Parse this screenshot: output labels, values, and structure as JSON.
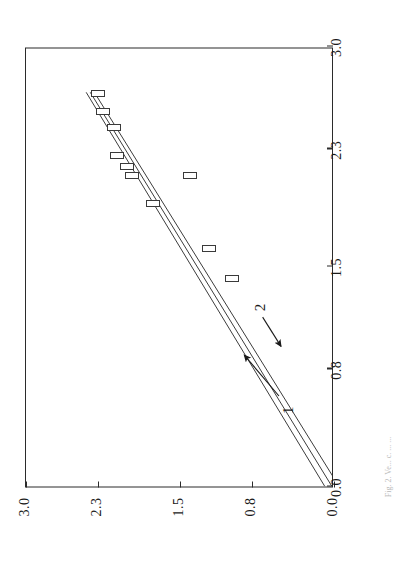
{
  "figure": {
    "rotation_note": "landscape-plot-rotated-90ccw",
    "caption": "Fig. 2.  Ve...  c. ...  ..."
  },
  "chart_data": {
    "type": "scatter",
    "title": "",
    "xlabel": "",
    "ylabel": "",
    "xlim": [
      0.0,
      3.0
    ],
    "ylim": [
      0.0,
      3.0
    ],
    "grid": false,
    "legend": "none",
    "xticks": [
      "0.0",
      "0.8",
      "1.5",
      "2.3",
      "3.0"
    ],
    "xtick_values": [
      0.0,
      0.8,
      1.5,
      2.3,
      3.0
    ],
    "yticks": [
      "0.0",
      "0.8",
      "1.5",
      "2.3",
      "3.0"
    ],
    "ytick_values": [
      0.0,
      0.8,
      1.5,
      2.3,
      3.0
    ],
    "marker_style": "open-rectangle",
    "points": [
      {
        "x": 1.42,
        "y": 0.99
      },
      {
        "x": 1.62,
        "y": 1.22
      },
      {
        "x": 1.93,
        "y": 1.76
      },
      {
        "x": 2.12,
        "y": 1.4
      },
      {
        "x": 2.12,
        "y": 1.97
      },
      {
        "x": 2.18,
        "y": 2.02
      },
      {
        "x": 2.26,
        "y": 2.11
      },
      {
        "x": 2.45,
        "y": 2.14
      },
      {
        "x": 2.56,
        "y": 2.25
      },
      {
        "x": 2.68,
        "y": 2.3
      }
    ],
    "series": [
      {
        "name": "1",
        "type": "line",
        "comment": "lower of the three regression lines",
        "x": [
          0.0,
          2.7
        ],
        "y": [
          -0.07,
          2.33
        ]
      },
      {
        "name": "middle",
        "type": "line",
        "comment": "central regression line",
        "x": [
          0.0,
          2.7
        ],
        "y": [
          0.0,
          2.37
        ]
      },
      {
        "name": "2",
        "type": "line",
        "comment": "upper of the three regression lines",
        "x": [
          0.0,
          2.7
        ],
        "y": [
          0.07,
          2.41
        ]
      }
    ],
    "annotations": [
      {
        "label": "1",
        "label_x": 0.52,
        "label_y": 0.45,
        "arrow_from_x": 0.62,
        "arrow_from_y": 0.52,
        "arrow_to_x": 0.9,
        "arrow_to_y": 0.86
      },
      {
        "label": "2",
        "label_x": 1.22,
        "label_y": 0.72,
        "arrow_from_x": 1.16,
        "arrow_from_y": 0.68,
        "arrow_to_x": 0.96,
        "arrow_to_y": 0.5
      }
    ]
  }
}
